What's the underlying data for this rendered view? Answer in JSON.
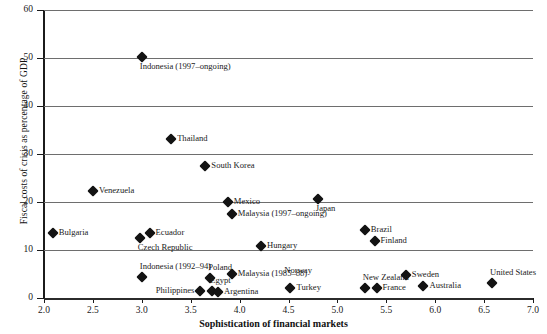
{
  "chart_data": {
    "type": "scatter",
    "title": "",
    "xlabel": "Sophistication of financial markets",
    "ylabel": "Fiscal costs of crisis as percentage of GDP",
    "xlim": [
      2.0,
      7.0
    ],
    "ylim": [
      0,
      60
    ],
    "xticks": [
      "2.0",
      "2.5",
      "3.0",
      "3.5",
      "4.0",
      "4.5",
      "5.0",
      "5.5",
      "6.0",
      "6.5",
      "7.0"
    ],
    "xtick_values": [
      2.0,
      2.5,
      3.0,
      3.5,
      4.0,
      4.5,
      5.0,
      5.5,
      6.0,
      6.5,
      7.0
    ],
    "yticks": [
      "0",
      "10",
      "20",
      "30",
      "40",
      "50",
      "60"
    ],
    "ytick_values": [
      0,
      10,
      20,
      30,
      40,
      50,
      60
    ],
    "grid": "horizontal",
    "legend": "none",
    "marker": "diamond",
    "marker_color": "#131313",
    "points": [
      {
        "label": "Indonesia (1997–ongoing)",
        "x": 3.0,
        "y": 50.2,
        "pos": "b"
      },
      {
        "label": "Thailand",
        "x": 3.3,
        "y": 33.1,
        "pos": "r"
      },
      {
        "label": "South Korea",
        "x": 3.65,
        "y": 27.4,
        "pos": "r"
      },
      {
        "label": "Venezuela",
        "x": 2.5,
        "y": 22.3,
        "pos": "r"
      },
      {
        "label": "Japan",
        "x": 4.8,
        "y": 20.6,
        "pos": "b"
      },
      {
        "label": "Mexico",
        "x": 3.88,
        "y": 20.0,
        "pos": "r"
      },
      {
        "label": "Malaysia (1997–ongoing)",
        "x": 3.92,
        "y": 17.4,
        "pos": "r"
      },
      {
        "label": "Brazil",
        "x": 5.28,
        "y": 14.1,
        "pos": "r"
      },
      {
        "label": "Bulgaria",
        "x": 2.09,
        "y": 13.6,
        "pos": "r"
      },
      {
        "label": "Ecuador",
        "x": 3.08,
        "y": 13.5,
        "pos": "r"
      },
      {
        "label": "Czech Republic",
        "x": 2.98,
        "y": 12.6,
        "pos": "b"
      },
      {
        "label": "Finland",
        "x": 5.38,
        "y": 11.8,
        "pos": "r"
      },
      {
        "label": "Hungary",
        "x": 4.22,
        "y": 10.8,
        "pos": "r"
      },
      {
        "label": "Norway",
        "x": 4.6,
        "y": 8.0,
        "pos": "hidden-label-below"
      },
      {
        "label": "Malaysia (1985–88)",
        "x": 3.92,
        "y": 5.1,
        "pos": "r"
      },
      {
        "label": "Sweden",
        "x": 5.7,
        "y": 4.8,
        "pos": "r"
      },
      {
        "label": "Indonesia (1992–94)",
        "x": 3.0,
        "y": 4.3,
        "pos": "t"
      },
      {
        "label": "Poland",
        "x": 3.7,
        "y": 4.1,
        "pos": "t"
      },
      {
        "label": "United States",
        "x": 6.58,
        "y": 3.1,
        "pos": "t"
      },
      {
        "label": "Australia",
        "x": 5.88,
        "y": 2.4,
        "pos": "r"
      },
      {
        "label": "Turkey",
        "x": 4.52,
        "y": 2.1,
        "pos": "r"
      },
      {
        "label": "New Zealand",
        "x": 5.28,
        "y": 2.0,
        "pos": "t"
      },
      {
        "label": "France",
        "x": 5.4,
        "y": 2.0,
        "pos": "r"
      },
      {
        "label": "Philippines",
        "x": 3.6,
        "y": 1.4,
        "pos": "l"
      },
      {
        "label": "Egypt",
        "x": 3.72,
        "y": 1.4,
        "pos": "t"
      },
      {
        "label": "Argentina",
        "x": 3.78,
        "y": 1.2,
        "pos": "r"
      }
    ]
  }
}
